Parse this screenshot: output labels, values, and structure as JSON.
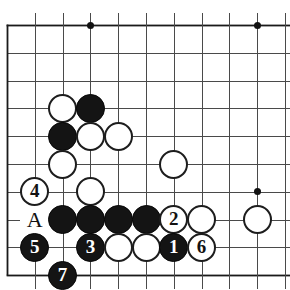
{
  "figure": {
    "name": "go-board-diagram",
    "caption_fragment": "",
    "board": {
      "origin_x": 7,
      "origin_y": 25,
      "cell": 27.8,
      "cols": 11,
      "rows": 10,
      "line_color": "#4a4a4a",
      "edge_color": "#1a1a1a",
      "background": "#ffffff",
      "left_edge_col": 0,
      "bottom_edge_row": 9,
      "top_edge_row": 0
    },
    "star_points": [
      {
        "col": 3,
        "row": 0
      },
      {
        "col": 9,
        "row": 0
      },
      {
        "col": 9,
        "row": 6
      }
    ],
    "stones": [
      {
        "id": "w-c2r3",
        "color": "white",
        "col": 2,
        "row": 3,
        "label": ""
      },
      {
        "id": "b-c3r3",
        "color": "black",
        "col": 3,
        "row": 3,
        "label": ""
      },
      {
        "id": "b-c2r4",
        "color": "black",
        "col": 2,
        "row": 4,
        "label": ""
      },
      {
        "id": "w-c3r4",
        "color": "white",
        "col": 3,
        "row": 4,
        "label": ""
      },
      {
        "id": "w-c4r4",
        "color": "white",
        "col": 4,
        "row": 4,
        "label": ""
      },
      {
        "id": "w-c2r5",
        "color": "white",
        "col": 2,
        "row": 5,
        "label": ""
      },
      {
        "id": "w-c6r5",
        "color": "white",
        "col": 6,
        "row": 5,
        "label": ""
      },
      {
        "id": "w-c1r6-move4",
        "color": "white",
        "col": 1,
        "row": 6,
        "label": "4"
      },
      {
        "id": "w-c3r6",
        "color": "white",
        "col": 3,
        "row": 6,
        "label": ""
      },
      {
        "id": "b-c2r7",
        "color": "black",
        "col": 2,
        "row": 7,
        "label": ""
      },
      {
        "id": "b-c3r7",
        "color": "black",
        "col": 3,
        "row": 7,
        "label": ""
      },
      {
        "id": "b-c4r7",
        "color": "black",
        "col": 4,
        "row": 7,
        "label": ""
      },
      {
        "id": "b-c5r7",
        "color": "black",
        "col": 5,
        "row": 7,
        "label": ""
      },
      {
        "id": "w-c6r7-move2",
        "color": "white",
        "col": 6,
        "row": 7,
        "label": "2"
      },
      {
        "id": "w-c7r7",
        "color": "white",
        "col": 7,
        "row": 7,
        "label": ""
      },
      {
        "id": "w-c9r7",
        "color": "white",
        "col": 9,
        "row": 7,
        "label": ""
      },
      {
        "id": "b-c1r8-move5",
        "color": "black",
        "col": 1,
        "row": 8,
        "label": "5"
      },
      {
        "id": "b-c3r8-move3",
        "color": "black",
        "col": 3,
        "row": 8,
        "label": "3"
      },
      {
        "id": "w-c4r8",
        "color": "white",
        "col": 4,
        "row": 8,
        "label": ""
      },
      {
        "id": "w-c5r8",
        "color": "white",
        "col": 5,
        "row": 8,
        "label": ""
      },
      {
        "id": "b-c6r8-move1",
        "color": "black",
        "col": 6,
        "row": 8,
        "label": "1"
      },
      {
        "id": "w-c7r8-move6",
        "color": "white",
        "col": 7,
        "row": 8,
        "label": "6"
      },
      {
        "id": "b-c2r9-move7",
        "color": "black",
        "col": 2,
        "row": 9,
        "label": "7"
      }
    ],
    "point_labels": [
      {
        "id": "label-A",
        "text": "A",
        "col": 1,
        "row": 7
      }
    ],
    "move_sequence": [
      "1",
      "2",
      "3",
      "4",
      "5",
      "6",
      "7"
    ]
  }
}
